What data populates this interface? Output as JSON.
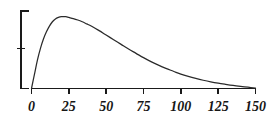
{
  "chart_data": {
    "type": "line",
    "title": "",
    "subtitle": "",
    "xlabel": "",
    "ylabel": "",
    "xlim": [
      0,
      150
    ],
    "ylim": [
      0,
      1.08
    ],
    "grid": false,
    "legend": null,
    "annotations": [],
    "x_ticks": [
      0,
      25,
      50,
      75,
      100,
      125,
      150
    ],
    "x_tick_labels": [
      "0",
      "25",
      "50",
      "75",
      "100",
      "125",
      "150"
    ],
    "y_ticks": [
      0.5
    ],
    "y_tick_labels": [
      ""
    ],
    "y_axis_style": "bracket-no-labels",
    "series": [
      {
        "name": "density",
        "x": [
          0,
          2,
          4,
          6,
          8,
          10,
          12,
          14,
          16,
          18,
          20,
          23,
          25,
          28,
          31,
          34,
          37,
          40,
          45,
          50,
          55,
          60,
          65,
          70,
          75,
          80,
          85,
          90,
          95,
          100,
          105,
          110,
          115,
          120,
          125,
          130,
          135,
          140,
          145,
          150
        ],
        "y": [
          0.0,
          0.2,
          0.4,
          0.56,
          0.69,
          0.79,
          0.87,
          0.93,
          0.97,
          0.99,
          1.0,
          1.0,
          0.99,
          0.975,
          0.955,
          0.93,
          0.9,
          0.87,
          0.81,
          0.745,
          0.68,
          0.615,
          0.55,
          0.49,
          0.43,
          0.375,
          0.325,
          0.28,
          0.24,
          0.2,
          0.168,
          0.14,
          0.115,
          0.093,
          0.074,
          0.058,
          0.043,
          0.03,
          0.018,
          0.006
        ]
      }
    ]
  },
  "style": {
    "curve_color": "#2b2b2b",
    "axis_color": "#1a1a1a",
    "label_color": "#161616",
    "background": "#ffffff"
  }
}
